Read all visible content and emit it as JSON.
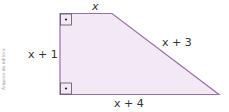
{
  "figure": {
    "shape": "right trapezoid",
    "fill_color": "#f3e8f6",
    "stroke_color": "#9b6fa8",
    "labels": {
      "top": "x",
      "left": "x + 1",
      "slant": "x + 3",
      "bottom": "x + 4"
    },
    "right_angle_markers": 2
  },
  "credit": "Arquivo da editora"
}
